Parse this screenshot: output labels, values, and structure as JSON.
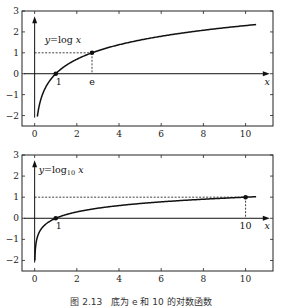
{
  "chart_data": [
    {
      "type": "line",
      "title": "",
      "function_label": "y = log x",
      "xlabel": "x",
      "ylabel": "",
      "xlim": [
        -0.6,
        11.3
      ],
      "ylim": [
        -2.5,
        3
      ],
      "x_ticks": [
        "0",
        "2",
        "4",
        "6",
        "8",
        "10"
      ],
      "y_ticks": [
        "−2",
        "−1",
        "0",
        "1",
        "2",
        "3"
      ],
      "grid": false,
      "series": [
        {
          "name": "log x",
          "x": [
            0.13,
            0.25,
            0.5,
            1,
            2,
            2.718,
            4,
            6,
            8,
            10.5
          ],
          "y": [
            -2.04,
            -1.39,
            -0.69,
            0,
            0.69,
            1,
            1.39,
            1.79,
            2.08,
            2.35
          ]
        }
      ],
      "points": [
        {
          "x": 1,
          "y": 0,
          "label": "1"
        },
        {
          "x": 2.718,
          "y": 1,
          "label": "e"
        }
      ],
      "guides": {
        "horizontal_dashed_y": 1,
        "vertical_dashed_x": 2.718
      }
    },
    {
      "type": "line",
      "title": "",
      "function_label_prefix": "y = log",
      "function_label_sub": "10",
      "function_label_suffix": "x",
      "xlabel": "x",
      "xlim": [
        -0.6,
        11.3
      ],
      "ylim": [
        -2.5,
        3
      ],
      "x_ticks": [
        "0",
        "2",
        "4",
        "6",
        "8",
        "10"
      ],
      "y_ticks": [
        "−2",
        "−1",
        "0",
        "1",
        "2",
        "3"
      ],
      "grid": false,
      "series": [
        {
          "name": "log10 x",
          "x": [
            0.01,
            0.05,
            0.2,
            0.5,
            1,
            2,
            4,
            6,
            8,
            10,
            10.5
          ],
          "y": [
            -2,
            -1.3,
            -0.7,
            -0.3,
            0,
            0.3,
            0.6,
            0.78,
            0.9,
            1,
            1.02
          ]
        }
      ],
      "points": [
        {
          "x": 1,
          "y": 0,
          "label": "1"
        },
        {
          "x": 10,
          "y": 1,
          "label": "10"
        }
      ],
      "guides": {
        "horizontal_dashed_y": 1,
        "vertical_dashed_x": 10
      }
    }
  ],
  "caption": "图 2.13　底为 e 和 10 的对数函数"
}
